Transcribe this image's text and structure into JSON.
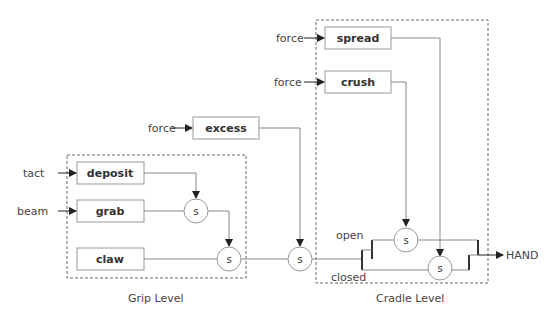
{
  "groups": [
    {
      "id": "grip",
      "label": "Grip Level"
    },
    {
      "id": "cradle",
      "label": "Cradle Level"
    }
  ],
  "blocks": {
    "deposit": "deposit",
    "grab": "grab",
    "claw": "claw",
    "excess": "excess",
    "spread": "spread",
    "crush": "crush"
  },
  "inputs": {
    "tact": "tact",
    "beam": "beam",
    "excess_force": "force",
    "spread_force": "force",
    "crush_force": "force"
  },
  "switch_label": "s",
  "branches": {
    "open": "open",
    "closed": "closed"
  },
  "output": "HAND",
  "colors": {
    "line": "#888888",
    "text": "#333333",
    "dashed_border": "#666666"
  }
}
